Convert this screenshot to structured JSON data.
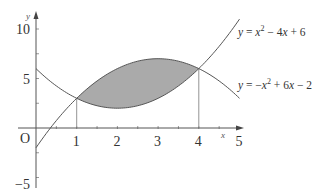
{
  "chart_data": {
    "type": "line",
    "title": "",
    "xlabel": "x",
    "ylabel": "y",
    "origin_label": "O",
    "xlim": [
      0,
      5
    ],
    "ylim": [
      -5,
      11
    ],
    "grid": false,
    "x_ticks": [
      {
        "value": 1,
        "label": "1"
      },
      {
        "value": 2,
        "label": "2"
      },
      {
        "value": 3,
        "label": "3"
      },
      {
        "value": 4,
        "label": "4"
      },
      {
        "value": 5,
        "label": "5"
      }
    ],
    "y_ticks": [
      {
        "value": 10,
        "label": "10"
      },
      {
        "value": 5,
        "label": "5"
      },
      {
        "value": -5,
        "label": "−5"
      }
    ],
    "series": [
      {
        "name": "y = x² − 4x + 6",
        "label_parts": [
          "y",
          " = ",
          "x",
          "2",
          " − 4",
          "x",
          " + 6"
        ],
        "coefficients": [
          1,
          -4,
          6
        ],
        "x": [
          0,
          1,
          2,
          3,
          4,
          5
        ],
        "values": [
          6,
          3,
          2,
          3,
          6,
          11
        ]
      },
      {
        "name": "y = −x² + 6x − 2",
        "label_parts": [
          "y",
          " = −",
          "x",
          "2",
          " + 6",
          "x",
          " − 2"
        ],
        "coefficients": [
          -1,
          6,
          -2
        ],
        "x": [
          0,
          1,
          2,
          3,
          4,
          5
        ],
        "values": [
          -2,
          3,
          6,
          7,
          6,
          3
        ]
      }
    ],
    "intersections": [
      {
        "x": 1,
        "y": 3
      },
      {
        "x": 4,
        "y": 6
      }
    ],
    "shaded_region": {
      "from_x": 1,
      "to_x": 4,
      "between": [
        "y = −x² + 6x − 2",
        "y = x² − 4x + 6"
      ],
      "color": "#aaaaaa"
    },
    "vertical_guides": [
      1,
      4
    ]
  }
}
